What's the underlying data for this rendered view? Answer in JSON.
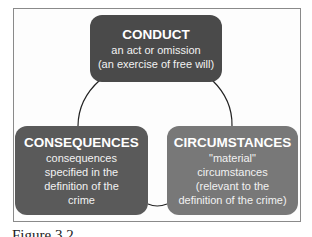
{
  "diagram": {
    "type": "cycle",
    "nodes": [
      {
        "id": "conduct",
        "title": "CONDUCT",
        "lines": [
          "an act or omission",
          "(an exercise of free will)"
        ],
        "color": "#4a4a4a"
      },
      {
        "id": "consequences",
        "title": "CONSEQUENCES",
        "lines": [
          "consequences",
          "specified in the",
          "definition of the",
          "crime"
        ],
        "color": "#5a5a5a"
      },
      {
        "id": "circumstances",
        "title": "CIRCUMSTANCES",
        "lines": [
          "\"material\"",
          "circumstances",
          "(relevant to the",
          "definition of the crime)"
        ],
        "color": "#787878"
      }
    ],
    "edges": [
      [
        "conduct",
        "circumstances"
      ],
      [
        "circumstances",
        "consequences"
      ],
      [
        "consequences",
        "conduct"
      ]
    ]
  },
  "caption": "Figure 3.2"
}
